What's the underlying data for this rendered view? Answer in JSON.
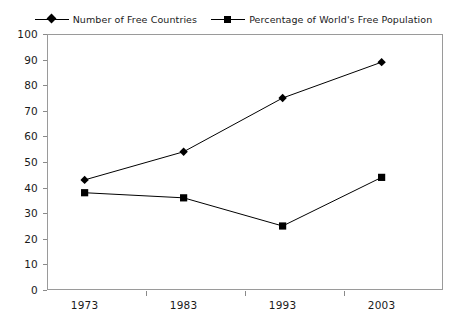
{
  "chart_data": {
    "type": "line",
    "title": "",
    "subtitle": "",
    "xlabel": "",
    "ylabel": "",
    "categories": [
      "1973",
      "1983",
      "1993",
      "2003"
    ],
    "series": [
      {
        "name": "Number of Free Countries",
        "marker": "diamond",
        "color": "#000000",
        "values": [
          43,
          54,
          75,
          89
        ]
      },
      {
        "name": "Percentage of World's Free Population",
        "marker": "square",
        "color": "#000000",
        "values": [
          38,
          36,
          25,
          44
        ]
      }
    ],
    "ylim": [
      0,
      100
    ],
    "y_ticks": [
      "0",
      "10",
      "20",
      "30",
      "40",
      "50",
      "60",
      "70",
      "80",
      "90",
      "100"
    ],
    "x_ticks": [
      "1973",
      "1983",
      "1993",
      "2003"
    ],
    "grid": false,
    "legend_position": "top",
    "frame": true
  },
  "legend": {
    "entries": [
      {
        "label": "Number of Free Countries",
        "marker": "diamond"
      },
      {
        "label": "Percentage of World's Free Population",
        "marker": "square"
      }
    ]
  },
  "colors": {
    "series_line": "#000000",
    "axis": "#9a9a9a",
    "text": "#1a1a1a",
    "background": "#ffffff"
  }
}
